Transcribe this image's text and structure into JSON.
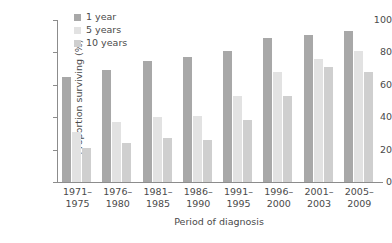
{
  "chart_data": {
    "type": "bar",
    "title": "",
    "xlabel": "Period of diagnosis",
    "ylabel": "Proportion surviving (%)",
    "ylim": [
      0,
      100
    ],
    "yticks": [
      0,
      20,
      40,
      60,
      80,
      100
    ],
    "grid": false,
    "legend_position": "top-left",
    "categories": [
      "1971–\n1975",
      "1976–\n1980",
      "1981–\n1985",
      "1986–\n1990",
      "1991–\n1995",
      "1996–\n2000",
      "2001–\n2003",
      "2005–\n2009"
    ],
    "series": [
      {
        "name": "1 year",
        "color": "#a8a8a8",
        "values": [
          65,
          69,
          75,
          77,
          81,
          89,
          91,
          93
        ]
      },
      {
        "name": "5 years",
        "color": "#e2e2e2",
        "values": [
          31,
          37,
          40,
          41,
          53,
          68,
          76,
          81
        ]
      },
      {
        "name": "10 years",
        "color": "#cfcfcf",
        "values": [
          21,
          24,
          27,
          26,
          38,
          53,
          71,
          68
        ]
      }
    ]
  },
  "axis": {
    "y_title": "Proportion surviving (%)",
    "x_title": "Period of diagnosis",
    "y_tick_labels": [
      "0",
      "20",
      "40",
      "60",
      "80",
      "100"
    ]
  },
  "legend": {
    "entries": [
      {
        "label": "1 year",
        "color": "#a8a8a8"
      },
      {
        "label": "5 years",
        "color": "#e2e2e2"
      },
      {
        "label": "10 years",
        "color": "#cfcfcf"
      }
    ]
  },
  "category_labels": [
    {
      "line1": "1971–",
      "line2": "1975"
    },
    {
      "line1": "1976–",
      "line2": "1980"
    },
    {
      "line1": "1981–",
      "line2": "1985"
    },
    {
      "line1": "1986–",
      "line2": "1990"
    },
    {
      "line1": "1991–",
      "line2": "1995"
    },
    {
      "line1": "1996–",
      "line2": "2000"
    },
    {
      "line1": "2001–",
      "line2": "2003"
    },
    {
      "line1": "2005–",
      "line2": "2009"
    }
  ]
}
